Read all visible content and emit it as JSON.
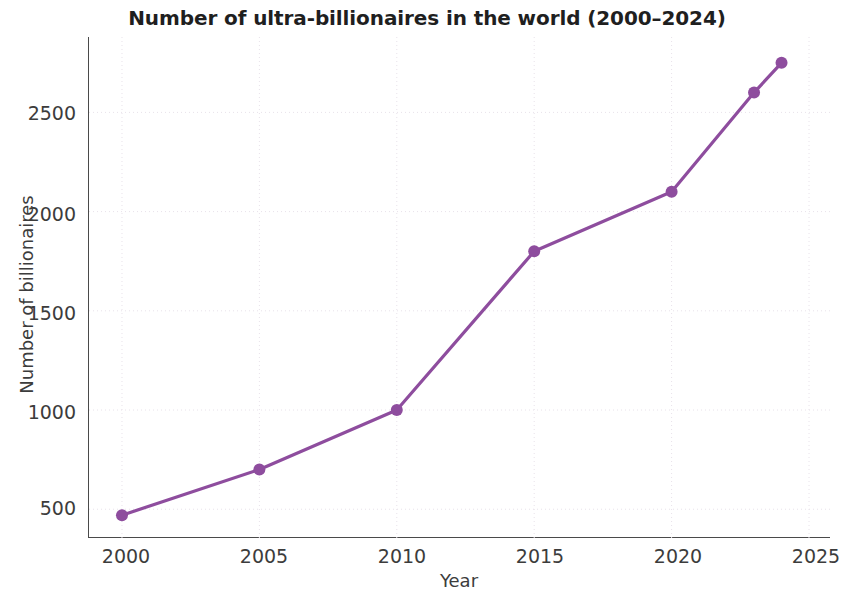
{
  "chart_data": {
    "type": "line",
    "title": "Number of ultra-billionaires in the world (2000–2024)",
    "xlabel": "Year",
    "ylabel": "Number of billionaires",
    "x": [
      2000,
      2005,
      2010,
      2015,
      2020,
      2023,
      2024
    ],
    "values": [
      470,
      700,
      1000,
      1800,
      2100,
      2600,
      2750
    ],
    "series": [
      {
        "name": "Number of billionaires",
        "values": [
          470,
          700,
          1000,
          1800,
          2100,
          2600,
          2750
        ]
      }
    ],
    "xlim": [
      1998.8,
      2025.8
    ],
    "ylim": [
      355,
      2880
    ],
    "xticks": [
      2000,
      2005,
      2010,
      2015,
      2020,
      2025
    ],
    "xtick_labels": [
      "2000",
      "2005",
      "2010",
      "2015",
      "2020",
      "2025"
    ],
    "yticks": [
      500,
      1000,
      1500,
      2000,
      2500
    ],
    "ytick_labels": [
      "500",
      "1000",
      "1500",
      "2000",
      "2500"
    ],
    "grid": true,
    "grid_style": "dotted",
    "legend": null,
    "line_color": "#8e4d9e",
    "marker_color": "#8e4d9e",
    "marker": "circle",
    "line_width": 3.2,
    "axis_color": "#4a4a4a",
    "grid_color": "#e8e2ea",
    "text_color": "#3c3c3c",
    "background": "#ffffff"
  }
}
